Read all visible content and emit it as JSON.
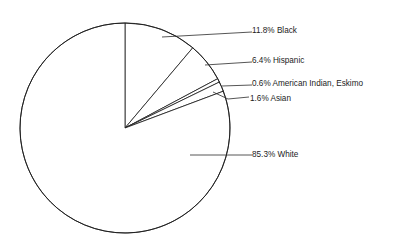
{
  "chart_data": {
    "type": "pie",
    "title": "",
    "subtitle": "",
    "xlabel": "",
    "ylabel": "",
    "legend_position": "none",
    "grid": false,
    "units": "percent",
    "start_angle_deg": 0,
    "direction": "clockwise",
    "categories": [
      "Black",
      "Hispanic",
      "American Indian, Eskimo",
      "Asian",
      "White"
    ],
    "values": [
      11.8,
      6.4,
      0.6,
      1.6,
      85.3
    ],
    "slices": [
      {
        "name": "black",
        "label": "11.8% Black",
        "percent_text": "11.8%",
        "category": "Black",
        "value": 11.8,
        "label_x": 252,
        "label_y": 31,
        "leader_path": "M 162 37 L 252 32",
        "fill": "#ffffff",
        "stroke": "#1a1a1a"
      },
      {
        "name": "hispanic",
        "label": "6.4% Hispanic",
        "percent_text": "6.4%",
        "category": "Hispanic",
        "value": 6.4,
        "label_x": 252,
        "label_y": 61,
        "leader_path": "M 205 65 L 252 62",
        "fill": "#ffffff",
        "stroke": "#1a1a1a"
      },
      {
        "name": "american-indian-eskimo",
        "label": "0.6% American Indian, Eskimo",
        "percent_text": "0.6%",
        "category": "American Indian, Eskimo",
        "value": 0.6,
        "label_x": 252,
        "label_y": 84,
        "leader_path": "M 222 86 L 252 85",
        "fill": "#ffffff",
        "stroke": "#1a1a1a"
      },
      {
        "name": "asian",
        "label": "1.6% Asian",
        "percent_text": "1.6%",
        "category": "Asian",
        "value": 1.6,
        "label_x": 250,
        "label_y": 99,
        "leader_path": "M 213 92 L 228 99 L 249 97",
        "fill": "#ffffff",
        "stroke": "#1a1a1a"
      },
      {
        "name": "white",
        "label": "85.3% White",
        "percent_text": "85.3%",
        "category": "White",
        "value": 85.3,
        "label_x": 252,
        "label_y": 155,
        "leader_path": "M 190 155 L 252 155",
        "fill": "#ffffff",
        "stroke": "#1a1a1a"
      }
    ],
    "geometry": {
      "center_x": 125,
      "center_y": 128,
      "radius": 105
    },
    "colors": {
      "background": "#ffffff",
      "outline": "#1a1a1a",
      "text": "#1c1c1c",
      "leader": "#2b2b2b"
    }
  }
}
